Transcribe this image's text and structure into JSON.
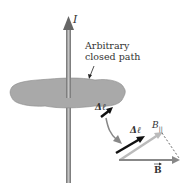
{
  "labels": {
    "current": "I",
    "path_line1": "Arbitrary",
    "path_line2": "closed path",
    "delta_l_on_path": "Δℓ",
    "delta_l_detail": "Δℓ",
    "b_parallel": "B",
    "b_parallel_sub": "||",
    "b_vector": "B"
  },
  "colors": {
    "surface": "#a8a8a8",
    "wire": "#8c8c8c",
    "dark_arrow": "#111111",
    "light_arrow": "#bbbbbb",
    "b_arrow": "#888888"
  }
}
